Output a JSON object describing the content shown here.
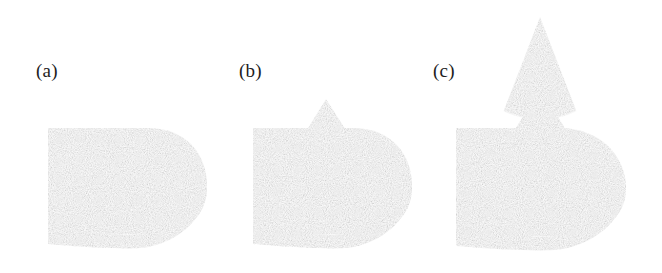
{
  "figure": {
    "caption_labels": [
      "(a)",
      "(b)",
      "(c)"
    ],
    "background_color": "#ffffff",
    "panel_count": 3
  },
  "panels": [
    {
      "id": "a",
      "label": "(a)",
      "label_x": 36,
      "label_y": 70,
      "slab": {
        "x": 48,
        "y": 128,
        "width": 160,
        "height": 116,
        "fill": "#9b9b9b",
        "side_fill": "#8a8a8a"
      },
      "ellipse": {
        "cx": 128,
        "cy": 186,
        "rx": 68,
        "ry": 42,
        "outline": "#1a1a1a",
        "fill": "#ffffff"
      },
      "feature": {
        "type": "dark-blob",
        "cx": 131,
        "cy": 188,
        "rx": 34,
        "ry": 22,
        "color": "#3a3a3a"
      },
      "cone": {
        "present": false,
        "apex_x": 0,
        "apex_y": 0,
        "height": 0
      }
    },
    {
      "id": "b",
      "label": "(b)",
      "label_x": 239,
      "label_y": 70,
      "slab": {
        "x": 253,
        "y": 128,
        "width": 160,
        "height": 116,
        "fill": "#9b9b9b",
        "side_fill": "#8a8a8a"
      },
      "ellipse": {
        "cx": 333,
        "cy": 186,
        "rx": 68,
        "ry": 42,
        "outline": "#1a1a1a",
        "fill": "#ffffff"
      },
      "feature": {
        "type": "cone",
        "color_upper": "#7b7b7b",
        "color_lower": "#f6f6f6"
      },
      "cone": {
        "present": true,
        "apex_x": 326,
        "apex_y": 99,
        "base_half_width": 36,
        "plane_y": 143,
        "base_y": 186,
        "height": 87
      }
    },
    {
      "id": "c",
      "label": "(c)",
      "label_x": 433,
      "label_y": 70,
      "slab": {
        "x": 456,
        "y": 128,
        "width": 170,
        "height": 116,
        "fill": "#9b9b9b",
        "side_fill": "#8a8a8a"
      },
      "ellipse": {
        "cx": 541,
        "cy": 186,
        "rx": 72,
        "ry": 44,
        "outline": "#1a1a1a",
        "fill": "#ffffff"
      },
      "feature": {
        "type": "cone",
        "color_upper": "#6f6f6f",
        "color_lower": "#f8f8f8"
      },
      "cone": {
        "present": true,
        "apex_x": 540,
        "apex_y": 17,
        "base_half_width": 56,
        "plane_y": 108,
        "base_y": 190,
        "height": 173
      }
    }
  ],
  "colors": {
    "slab_gray": "#9b9b9b",
    "slab_shadow": "#8a8a8a",
    "cone_dark": "#727272",
    "cone_light": "#f8f8f8",
    "outline": "#1a1a1a",
    "blob_dark": "#3a3a3a",
    "paper_white": "#ffffff"
  }
}
